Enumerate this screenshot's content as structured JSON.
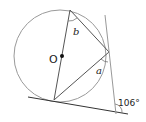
{
  "diagram": {
    "type": "circle-geometry",
    "center_label": "O",
    "angle_labels": {
      "b": "b",
      "a": "a",
      "given": "106°"
    },
    "colors": {
      "circle": "#9a9a9a",
      "lines": "#555555",
      "tangent": "#333333",
      "text": "#222222"
    }
  }
}
